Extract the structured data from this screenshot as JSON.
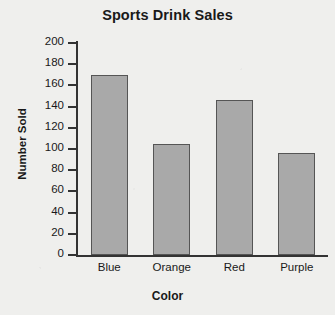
{
  "chart_data": {
    "type": "bar",
    "title": "Sports Drink Sales",
    "xlabel": "Color",
    "ylabel": "Number Sold",
    "categories": [
      "Blue",
      "Orange",
      "Red",
      "Purple"
    ],
    "values": [
      170,
      105,
      146,
      96
    ],
    "ylim": [
      0,
      200
    ],
    "ytick_step": 20,
    "yticks": [
      0,
      20,
      40,
      60,
      80,
      100,
      120,
      140,
      160,
      180,
      200
    ],
    "ytick_labels": [
      "0",
      "20",
      "40",
      "60",
      "80",
      "100",
      "120",
      "140",
      "160",
      "180",
      "200"
    ],
    "grid": false,
    "legend": false,
    "bar_fill_color": "#a9a9a9",
    "bar_edge_color": "#555555",
    "background_color": "#efefed",
    "axis_color": "#333333",
    "text_color": "#191919"
  }
}
